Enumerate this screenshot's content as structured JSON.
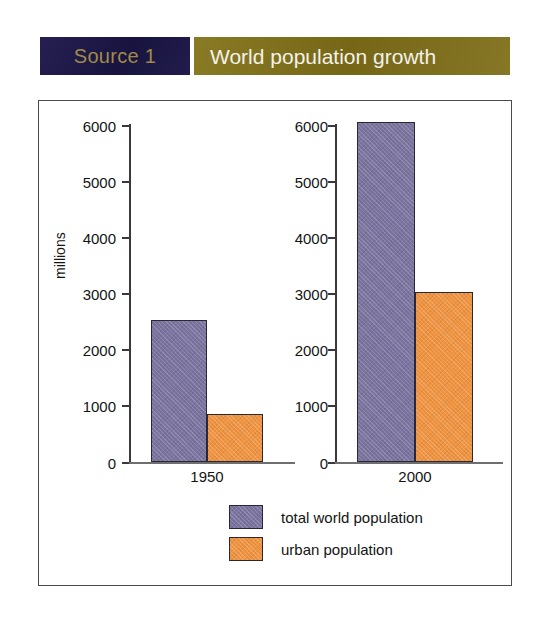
{
  "header": {
    "source_label": "Source 1",
    "title": "World population growth",
    "badge_bg": "#1e1a4a",
    "badge_text_color": "#a08a49",
    "title_bg": "#7d6e1e",
    "title_text_color": "#f4f2ea"
  },
  "chart_data": {
    "type": "bar",
    "title": "World population growth",
    "xlabel": "",
    "ylabel": "millions",
    "ylim": [
      0,
      6000
    ],
    "yticks": [
      0,
      1000,
      2000,
      3000,
      4000,
      5000,
      6000
    ],
    "ytick_labels": [
      "0",
      "1000",
      "2000",
      "3000",
      "4000",
      "5000",
      "6000"
    ],
    "grid": false,
    "legend_position": "bottom",
    "categories": [
      "1950",
      "2000"
    ],
    "series": [
      {
        "name": "total world population",
        "color": "#7b74a0",
        "values": [
          2520,
          6050
        ]
      },
      {
        "name": "urban population",
        "color": "#f0933f",
        "values": [
          850,
          3030
        ]
      }
    ],
    "panels": [
      {
        "category": "1950",
        "bars": [
          {
            "series": "total world population",
            "value": 2520
          },
          {
            "series": "urban population",
            "value": 850
          }
        ]
      },
      {
        "category": "2000",
        "bars": [
          {
            "series": "total world population",
            "value": 6050
          },
          {
            "series": "urban population",
            "value": 3030
          }
        ]
      }
    ]
  }
}
